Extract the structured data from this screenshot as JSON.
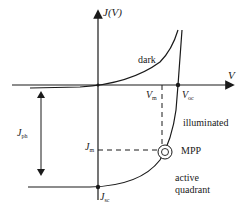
{
  "diagram": {
    "axes": {
      "y_label": "J(V)",
      "x_label": "V"
    },
    "curves": {
      "dark": "dark",
      "illuminated": "illuminated"
    },
    "markers": {
      "vm": "V",
      "vm_sub": "m",
      "voc": "V",
      "voc_sub": "oc",
      "jm": "J",
      "jm_sub": "m",
      "jsc": "J",
      "jsc_sub": "sc",
      "jph": "J",
      "jph_sub": "ph"
    },
    "annotations": {
      "mpp": "MPP",
      "active_line1": "active",
      "active_line2": "quadrant"
    },
    "colors": {
      "line": "#1a1a1a",
      "background": "#ffffff"
    }
  }
}
